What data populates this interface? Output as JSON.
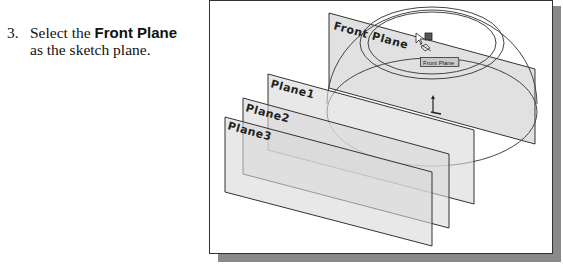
{
  "instruction": {
    "step_number": "3.",
    "text_before": "Select the ",
    "bold_text": "Front Plane",
    "text_after": "as the sketch plane."
  },
  "viewport": {
    "planes": [
      {
        "name": "Front Plane"
      },
      {
        "name": "Plane1"
      },
      {
        "name": "Plane2"
      },
      {
        "name": "Plane3"
      }
    ],
    "tooltip": "Front Plane"
  },
  "colors": {
    "plane_fill": "#d9d9d9",
    "frame_shadow": "#8a8a8a",
    "outline": "#333333"
  }
}
